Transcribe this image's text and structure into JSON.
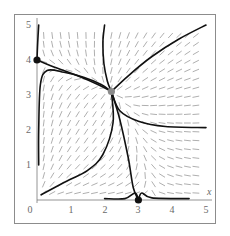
{
  "chart_data": {
    "type": "line",
    "title": "",
    "subtitle": "",
    "xlabel": "x",
    "ylabel": "",
    "xlim": [
      0,
      5
    ],
    "ylim": [
      0,
      5
    ],
    "x_ticks": [
      "0",
      "1",
      "2",
      "3",
      "4",
      "5"
    ],
    "y_ticks": [
      "1",
      "2",
      "3",
      "4",
      "5"
    ],
    "grid": false,
    "legend": null,
    "equilibria": [
      {
        "name": "stable-node-y-axis",
        "x": 0,
        "y": 4,
        "color": "#111111"
      },
      {
        "name": "stable-node-x-axis",
        "x": 3,
        "y": 0,
        "color": "#111111"
      },
      {
        "name": "saddle",
        "x": 2.2,
        "y": 3.1,
        "color": "#8a8a8a"
      }
    ],
    "series": [
      {
        "name": "y-axis-upper",
        "points": [
          [
            0.05,
            5.0
          ],
          [
            0.02,
            4.5
          ],
          [
            0.0,
            4.0
          ]
        ]
      },
      {
        "name": "node04-to-saddle",
        "points": [
          [
            0.0,
            4.0
          ],
          [
            0.5,
            3.8
          ],
          [
            1.2,
            3.55
          ],
          [
            1.8,
            3.3
          ],
          [
            2.2,
            3.1
          ]
        ]
      },
      {
        "name": "top-to-saddle",
        "points": [
          [
            2.0,
            5.0
          ],
          [
            1.95,
            4.5
          ],
          [
            1.98,
            3.9
          ],
          [
            2.08,
            3.4
          ],
          [
            2.2,
            3.1
          ]
        ]
      },
      {
        "name": "topright-to-saddle",
        "points": [
          [
            5.0,
            5.0
          ],
          [
            4.2,
            4.6
          ],
          [
            3.4,
            4.1
          ],
          [
            2.7,
            3.55
          ],
          [
            2.2,
            3.1
          ]
        ]
      },
      {
        "name": "left-loop-to-saddle",
        "points": [
          [
            0.05,
            1.0
          ],
          [
            0.05,
            2.0
          ],
          [
            0.1,
            3.3
          ],
          [
            0.3,
            3.7
          ],
          [
            0.8,
            3.65
          ],
          [
            1.4,
            3.5
          ],
          [
            1.9,
            3.3
          ],
          [
            2.2,
            3.1
          ]
        ]
      },
      {
        "name": "saddle-to-right-horizontal",
        "points": [
          [
            2.2,
            3.1
          ],
          [
            2.45,
            2.55
          ],
          [
            3.0,
            2.25
          ],
          [
            3.8,
            2.1
          ],
          [
            5.0,
            2.07
          ]
        ]
      },
      {
        "name": "saddle-to-node30",
        "points": [
          [
            2.2,
            3.1
          ],
          [
            2.45,
            2.3
          ],
          [
            2.7,
            1.2
          ],
          [
            2.85,
            0.35
          ],
          [
            3.0,
            0.0
          ]
        ]
      },
      {
        "name": "xaxis-left-to-node30",
        "points": [
          [
            2.0,
            0.04
          ],
          [
            2.6,
            0.04
          ],
          [
            2.9,
            0.2
          ],
          [
            3.0,
            0.0
          ]
        ]
      },
      {
        "name": "xaxis-right-to-node30",
        "points": [
          [
            4.5,
            0.04
          ],
          [
            3.4,
            0.06
          ],
          [
            3.1,
            0.2
          ],
          [
            3.0,
            0.0
          ]
        ]
      },
      {
        "name": "origin-to-saddle",
        "points": [
          [
            0.12,
            0.15
          ],
          [
            0.8,
            0.5
          ],
          [
            1.5,
            0.85
          ],
          [
            1.95,
            1.3
          ],
          [
            2.25,
            2.2
          ],
          [
            2.2,
            3.1
          ]
        ]
      }
    ],
    "direction_field": {
      "grid_x_range": [
        0.2,
        4.9
      ],
      "grid_y_range": [
        0.2,
        4.9
      ],
      "spacing": 0.25,
      "arrow_color": "#9a9a9a"
    }
  },
  "axes": {
    "x_label": "x",
    "x_tick_labels": [
      "0",
      "1",
      "2",
      "3",
      "4",
      "5"
    ],
    "y_tick_labels": [
      "1",
      "2",
      "3",
      "4",
      "5"
    ]
  }
}
